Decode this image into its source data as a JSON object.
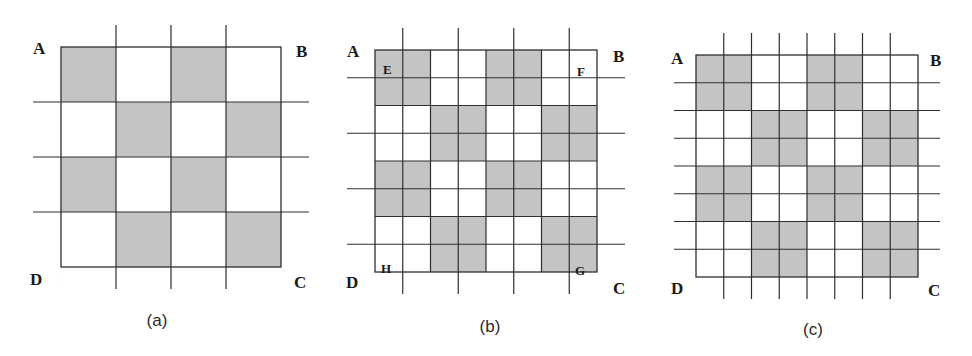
{
  "colors": {
    "shade": "#c4c4c4",
    "line": "#2e2e2e",
    "background": "#ffffff"
  },
  "panels": [
    {
      "id": "a",
      "caption": "(a)",
      "caption_pos": [
        157,
        326
      ],
      "square": {
        "x": 61,
        "y": 47,
        "size": 220,
        "rows": 4,
        "cols": 4
      },
      "shaded_cells": [
        [
          0,
          0
        ],
        [
          0,
          2
        ],
        [
          1,
          1
        ],
        [
          1,
          3
        ],
        [
          2,
          0
        ],
        [
          2,
          2
        ],
        [
          3,
          1
        ],
        [
          3,
          3
        ]
      ],
      "extended_lines": {
        "vertical": [
          1,
          2,
          3
        ],
        "horizontal": [
          1,
          2,
          3
        ],
        "overshoot_v": 22,
        "overshoot_h": 28
      },
      "inner_lines": {
        "vertical": [],
        "horizontal": []
      },
      "corner_labels": [
        {
          "text": "A",
          "x": 33,
          "y": 54
        },
        {
          "text": "B",
          "x": 296,
          "y": 57
        },
        {
          "text": "C",
          "x": 294,
          "y": 288
        },
        {
          "text": "D",
          "x": 30,
          "y": 285
        }
      ],
      "inner_labels": []
    },
    {
      "id": "b",
      "caption": "(b)",
      "caption_pos": [
        490,
        332
      ],
      "square": {
        "x": 375,
        "y": 50,
        "size": 222,
        "rows": 8,
        "cols": 8
      },
      "shaded_cells": [
        [
          0,
          0
        ],
        [
          0,
          1
        ],
        [
          1,
          0
        ],
        [
          1,
          1
        ],
        [
          0,
          4
        ],
        [
          0,
          5
        ],
        [
          1,
          4
        ],
        [
          1,
          5
        ],
        [
          2,
          2
        ],
        [
          2,
          3
        ],
        [
          3,
          2
        ],
        [
          3,
          3
        ],
        [
          2,
          6
        ],
        [
          2,
          7
        ],
        [
          3,
          6
        ],
        [
          3,
          7
        ],
        [
          4,
          0
        ],
        [
          4,
          1
        ],
        [
          5,
          0
        ],
        [
          5,
          1
        ],
        [
          4,
          4
        ],
        [
          4,
          5
        ],
        [
          5,
          4
        ],
        [
          5,
          5
        ],
        [
          6,
          2
        ],
        [
          6,
          3
        ],
        [
          7,
          2
        ],
        [
          7,
          3
        ],
        [
          6,
          6
        ],
        [
          6,
          7
        ],
        [
          7,
          6
        ],
        [
          7,
          7
        ]
      ],
      "extended_lines": {
        "vertical": [
          1,
          3,
          5,
          7
        ],
        "horizontal": [
          1,
          3,
          5,
          7
        ],
        "overshoot_v": 22,
        "overshoot_h": 28
      },
      "inner_lines": {
        "vertical": [
          2,
          4,
          6
        ],
        "horizontal": [
          2,
          4,
          6
        ]
      },
      "corner_labels": [
        {
          "text": "A",
          "x": 347,
          "y": 57
        },
        {
          "text": "B",
          "x": 613,
          "y": 62
        },
        {
          "text": "C",
          "x": 613,
          "y": 294
        },
        {
          "text": "D",
          "x": 346,
          "y": 288
        }
      ],
      "inner_labels": [
        {
          "text": "E",
          "x": 383,
          "y": 74
        },
        {
          "text": "F",
          "x": 577,
          "y": 76
        },
        {
          "text": "G",
          "x": 575,
          "y": 275
        },
        {
          "text": "H",
          "x": 381,
          "y": 273
        }
      ]
    },
    {
      "id": "c",
      "caption": "(c)",
      "caption_pos": [
        813,
        335
      ],
      "square": {
        "x": 696,
        "y": 55,
        "size": 222,
        "rows": 8,
        "cols": 8
      },
      "shaded_cells": [
        [
          0,
          0
        ],
        [
          0,
          1
        ],
        [
          1,
          0
        ],
        [
          1,
          1
        ],
        [
          0,
          4
        ],
        [
          0,
          5
        ],
        [
          1,
          4
        ],
        [
          1,
          5
        ],
        [
          2,
          2
        ],
        [
          2,
          3
        ],
        [
          3,
          2
        ],
        [
          3,
          3
        ],
        [
          2,
          6
        ],
        [
          2,
          7
        ],
        [
          3,
          6
        ],
        [
          3,
          7
        ],
        [
          4,
          0
        ],
        [
          4,
          1
        ],
        [
          5,
          0
        ],
        [
          5,
          1
        ],
        [
          4,
          4
        ],
        [
          4,
          5
        ],
        [
          5,
          4
        ],
        [
          5,
          5
        ],
        [
          6,
          2
        ],
        [
          6,
          3
        ],
        [
          7,
          2
        ],
        [
          7,
          3
        ],
        [
          6,
          6
        ],
        [
          6,
          7
        ],
        [
          7,
          6
        ],
        [
          7,
          7
        ]
      ],
      "extended_lines": {
        "vertical": [
          1,
          2,
          3,
          4,
          5,
          6,
          7
        ],
        "horizontal": [
          1,
          2,
          3,
          4,
          5,
          6,
          7
        ],
        "overshoot_v": 22,
        "overshoot_h": 22
      },
      "inner_lines": {
        "vertical": [],
        "horizontal": []
      },
      "corner_labels": [
        {
          "text": "A",
          "x": 671,
          "y": 64
        },
        {
          "text": "B",
          "x": 930,
          "y": 66
        },
        {
          "text": "C",
          "x": 928,
          "y": 296
        },
        {
          "text": "D",
          "x": 671,
          "y": 294
        }
      ],
      "inner_labels": []
    }
  ]
}
